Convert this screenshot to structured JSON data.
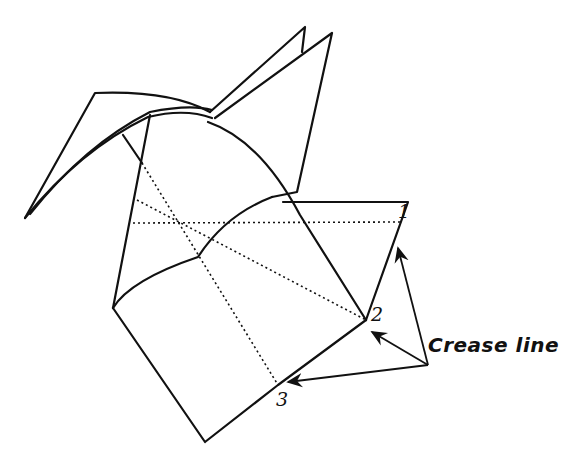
{
  "diagram": {
    "labels": {
      "point_1": "1",
      "point_2": "2",
      "point_3": "3",
      "annotation": "Crease line"
    },
    "colors": {
      "stroke": "#111111",
      "background": "#ffffff"
    }
  }
}
